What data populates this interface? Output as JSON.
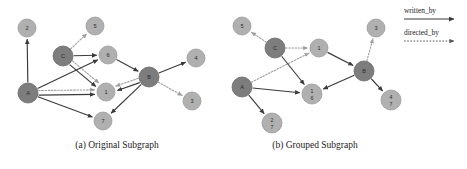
{
  "figure": {
    "width": 467,
    "height": 169,
    "background": "#ffffff"
  },
  "colors": {
    "hub_node": "#7d7d7d",
    "plain_node": "#b0b0b0",
    "written_by_edge": "#3a3a3a",
    "directed_by_edge": "#9f9f9f",
    "text": "#1a1a1a"
  },
  "legend": {
    "items": [
      {
        "label": "written_by",
        "style": "solid",
        "color": "#3a3a3a",
        "icon": "solid-arrow-icon"
      },
      {
        "label": "directed_by",
        "style": "dotted",
        "color": "#9f9f9f",
        "icon": "dotted-arrow-icon"
      }
    ]
  },
  "captions": {
    "panel_a": "(a) Original Subgraph",
    "panel_b": "(b) Grouped Subgraph"
  },
  "chart_data": {
    "type": "diagram",
    "title": "",
    "graphs": [
      {
        "id": "original-subgraph",
        "caption": "(a) Original Subgraph",
        "nodes": [
          {
            "id": "2",
            "label": "2",
            "labels": [
              "2"
            ],
            "kind": "plain",
            "x": 27,
            "y": 28,
            "r": 9
          },
          {
            "id": "5",
            "label": "5",
            "labels": [
              "5"
            ],
            "kind": "plain",
            "x": 95,
            "y": 26,
            "r": 9
          },
          {
            "id": "C",
            "label": "C",
            "labels": [
              "C"
            ],
            "kind": "hub",
            "x": 63,
            "y": 56,
            "r": 10
          },
          {
            "id": "6",
            "label": "6",
            "labels": [
              "6"
            ],
            "kind": "plain",
            "x": 108,
            "y": 55,
            "r": 9
          },
          {
            "id": "4",
            "label": "4",
            "labels": [
              "4"
            ],
            "kind": "plain",
            "x": 196,
            "y": 58,
            "r": 9
          },
          {
            "id": "A",
            "label": "A",
            "labels": [
              "A"
            ],
            "kind": "hub",
            "x": 28,
            "y": 93,
            "r": 10
          },
          {
            "id": "1",
            "label": "1",
            "labels": [
              "1"
            ],
            "kind": "plain",
            "x": 106,
            "y": 92,
            "r": 9
          },
          {
            "id": "B",
            "label": "B",
            "labels": [
              "B"
            ],
            "kind": "hub",
            "x": 149,
            "y": 77,
            "r": 10
          },
          {
            "id": "3",
            "label": "3",
            "labels": [
              "3"
            ],
            "kind": "plain",
            "x": 192,
            "y": 101,
            "r": 9
          },
          {
            "id": "7",
            "label": "7",
            "labels": [
              "7"
            ],
            "kind": "plain",
            "x": 103,
            "y": 121,
            "r": 9
          }
        ],
        "edges": [
          {
            "from": "A",
            "to": "2",
            "relation": "written_by",
            "style": "solid"
          },
          {
            "from": "C",
            "to": "5",
            "relation": "directed_by",
            "style": "dotted"
          },
          {
            "from": "C",
            "to": "6",
            "relation": "written_by",
            "style": "solid"
          },
          {
            "from": "C",
            "to": "1",
            "relation": "directed_by",
            "style": "dotted"
          },
          {
            "from": "C",
            "to": "1",
            "relation": "written_by",
            "style": "solid"
          },
          {
            "from": "A",
            "to": "6",
            "relation": "written_by",
            "style": "solid"
          },
          {
            "from": "A",
            "to": "1",
            "relation": "directed_by",
            "style": "dotted"
          },
          {
            "from": "A",
            "to": "1",
            "relation": "written_by",
            "style": "solid"
          },
          {
            "from": "A",
            "to": "7",
            "relation": "written_by",
            "style": "solid"
          },
          {
            "from": "6",
            "to": "B",
            "relation": "written_by",
            "style": "solid"
          },
          {
            "from": "B",
            "to": "1",
            "relation": "written_by",
            "style": "solid"
          },
          {
            "from": "B",
            "to": "1",
            "relation": "directed_by",
            "style": "dotted"
          },
          {
            "from": "B",
            "to": "4",
            "relation": "written_by",
            "style": "solid"
          },
          {
            "from": "B",
            "to": "3",
            "relation": "directed_by",
            "style": "dotted"
          },
          {
            "from": "B",
            "to": "7",
            "relation": "written_by",
            "style": "solid"
          }
        ]
      },
      {
        "id": "grouped-subgraph",
        "caption": "(b) Grouped Subgraph",
        "nodes": [
          {
            "id": "5",
            "label": "5",
            "labels": [
              "5"
            ],
            "kind": "plain",
            "x": 17,
            "y": 26,
            "r": 9
          },
          {
            "id": "C",
            "label": "C",
            "labels": [
              "C"
            ],
            "kind": "hub",
            "x": 50,
            "y": 48,
            "r": 10
          },
          {
            "id": "1",
            "label": "1",
            "labels": [
              "1"
            ],
            "kind": "plain",
            "x": 94,
            "y": 48,
            "r": 9
          },
          {
            "id": "3",
            "label": "3",
            "labels": [
              "3"
            ],
            "kind": "plain",
            "x": 151,
            "y": 28,
            "r": 9
          },
          {
            "id": "B",
            "label": "B",
            "labels": [
              "B"
            ],
            "kind": "hub",
            "x": 139,
            "y": 71,
            "r": 10
          },
          {
            "id": "A",
            "label": "A",
            "labels": [
              "A"
            ],
            "kind": "hub",
            "x": 17,
            "y": 87,
            "r": 10
          },
          {
            "id": "1_6",
            "label": "1/6",
            "labels": [
              "1",
              "6"
            ],
            "kind": "plain",
            "x": 87,
            "y": 94,
            "r": 10
          },
          {
            "id": "4_7",
            "label": "4/7",
            "labels": [
              "4",
              "7"
            ],
            "kind": "plain",
            "x": 166,
            "y": 100,
            "r": 10
          },
          {
            "id": "2_7",
            "label": "2/7",
            "labels": [
              "2",
              "7"
            ],
            "kind": "plain",
            "x": 47,
            "y": 123,
            "r": 10
          }
        ],
        "edges": [
          {
            "from": "C",
            "to": "5",
            "relation": "directed_by",
            "style": "dotted"
          },
          {
            "from": "C",
            "to": "1",
            "relation": "directed_by",
            "style": "dotted"
          },
          {
            "from": "A",
            "to": "1",
            "relation": "directed_by",
            "style": "dotted"
          },
          {
            "from": "C",
            "to": "1_6",
            "relation": "written_by",
            "style": "solid"
          },
          {
            "from": "A",
            "to": "1_6",
            "relation": "written_by",
            "style": "solid"
          },
          {
            "from": "A",
            "to": "2_7",
            "relation": "written_by",
            "style": "solid"
          },
          {
            "from": "1",
            "to": "B",
            "relation": "written_by",
            "style": "solid"
          },
          {
            "from": "B",
            "to": "3",
            "relation": "directed_by",
            "style": "dotted"
          },
          {
            "from": "B",
            "to": "1_6",
            "relation": "written_by",
            "style": "solid"
          },
          {
            "from": "B",
            "to": "4_7",
            "relation": "written_by",
            "style": "solid"
          }
        ]
      }
    ]
  }
}
